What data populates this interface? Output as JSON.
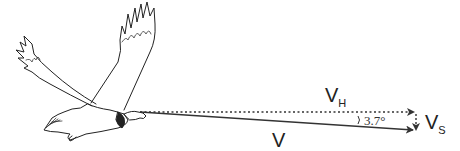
{
  "diagram": {
    "vectors": [
      {
        "id": "V",
        "label": "V",
        "description": "flight velocity along glide path",
        "style": "solid"
      },
      {
        "id": "VH",
        "label": "V",
        "subscript": "H",
        "description": "horizontal velocity component",
        "style": "dotted"
      },
      {
        "id": "VS",
        "label": "V",
        "subscript": "S",
        "description": "sinking (vertical) velocity component",
        "style": "dotted"
      }
    ],
    "angle": {
      "label": "3.7°",
      "description": "glide angle between V and V_H"
    },
    "colors": {
      "line": "#333333",
      "text": "#222222",
      "background": "#ffffff"
    }
  }
}
